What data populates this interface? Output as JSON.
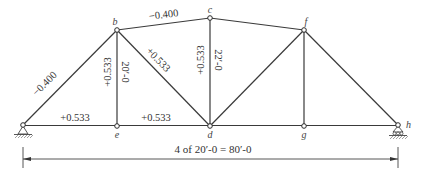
{
  "figure": {
    "type": "truss-influence-coefficients",
    "nodes": [
      {
        "id": "a",
        "x": 23,
        "y": 125,
        "label": ""
      },
      {
        "id": "b",
        "x": 117,
        "y": 30,
        "label": "b"
      },
      {
        "id": "c",
        "x": 210,
        "y": 18,
        "label": "c"
      },
      {
        "id": "f",
        "x": 304,
        "y": 30,
        "label": "f"
      },
      {
        "id": "e",
        "x": 117,
        "y": 126,
        "label": "e"
      },
      {
        "id": "d",
        "x": 210,
        "y": 126,
        "label": "d"
      },
      {
        "id": "g",
        "x": 304,
        "y": 126,
        "label": "g"
      },
      {
        "id": "h",
        "x": 398,
        "y": 125,
        "label": "h"
      }
    ],
    "members": [
      {
        "from": "a",
        "to": "b",
        "force": "−0.400"
      },
      {
        "from": "b",
        "to": "c",
        "force": "−0.400"
      },
      {
        "from": "c",
        "to": "f",
        "force": ""
      },
      {
        "from": "f",
        "to": "h",
        "force": ""
      },
      {
        "from": "a",
        "to": "e",
        "force": "+0.533"
      },
      {
        "from": "e",
        "to": "d",
        "force": "+0.533"
      },
      {
        "from": "d",
        "to": "g",
        "force": ""
      },
      {
        "from": "g",
        "to": "h",
        "force": ""
      },
      {
        "from": "b",
        "to": "e",
        "force": "+0.533"
      },
      {
        "from": "b",
        "to": "d",
        "force": "+0.533"
      },
      {
        "from": "c",
        "to": "d",
        "force": "+0.533"
      },
      {
        "from": "d",
        "to": "f",
        "force": ""
      },
      {
        "from": "f",
        "to": "g",
        "force": ""
      }
    ],
    "labels": {
      "ab": "−0.400",
      "bc": "−0.400",
      "ae": "+0.533",
      "ed": "+0.533",
      "be": "+0.533",
      "bd": "+0.533",
      "cd": "+0.533",
      "be_height": "20′-0",
      "cd_height": "22′-0"
    },
    "supports": {
      "left": "pin",
      "right": "roller"
    },
    "dimension": {
      "text": "4 of 20′-0 = 80′-0"
    }
  }
}
